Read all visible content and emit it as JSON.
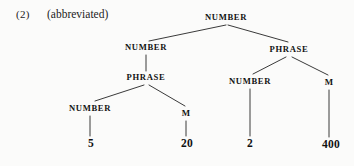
{
  "example": {
    "number_label": "(2)",
    "caption": "(abbreviated)"
  },
  "tree": {
    "nodes": {
      "root": "NUMBER",
      "level2_left": "NUMBER",
      "level2_right": "PHRASE",
      "level3_left_phrase": "PHRASE",
      "level3_right_number": "NUMBER",
      "level3_right_m": "M",
      "level4_number": "NUMBER",
      "level4_m": "M"
    },
    "leaves": {
      "leaf_5": "5",
      "leaf_20": "20",
      "leaf_2": "2",
      "leaf_400": "400"
    }
  },
  "style": {
    "line_color": "#242424",
    "text_color": "#121212",
    "background": "#fbfbfa"
  }
}
